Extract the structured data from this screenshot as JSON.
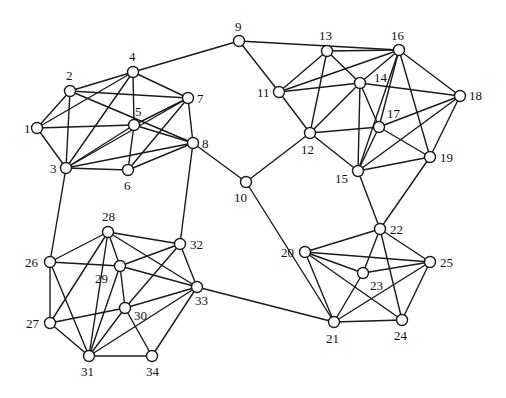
{
  "diagram": {
    "type": "undirected-graph",
    "node_radius": 5.5,
    "colors": {
      "edge": "#1a1a1a",
      "node_fill": "#ffffff",
      "label": "#111111",
      "background": "#ffffff"
    },
    "nodes": [
      {
        "id": "1",
        "x": 37,
        "y": 128,
        "lx": 24,
        "ly": 133
      },
      {
        "id": "2",
        "x": 70,
        "y": 91,
        "lx": 66,
        "ly": 80
      },
      {
        "id": "3",
        "x": 66,
        "y": 168,
        "lx": 50,
        "ly": 173
      },
      {
        "id": "4",
        "x": 133,
        "y": 72,
        "lx": 129,
        "ly": 61
      },
      {
        "id": "5",
        "x": 134,
        "y": 125,
        "lx": 135,
        "ly": 116
      },
      {
        "id": "6",
        "x": 128,
        "y": 170,
        "lx": 124,
        "ly": 190
      },
      {
        "id": "7",
        "x": 188,
        "y": 98,
        "lx": 197,
        "ly": 103
      },
      {
        "id": "8",
        "x": 193,
        "y": 143,
        "lx": 202,
        "ly": 148
      },
      {
        "id": "9",
        "x": 239,
        "y": 41,
        "lx": 235,
        "ly": 31
      },
      {
        "id": "10",
        "x": 246,
        "y": 182,
        "lx": 234,
        "ly": 202
      },
      {
        "id": "11",
        "x": 279,
        "y": 92,
        "lx": 257,
        "ly": 97
      },
      {
        "id": "12",
        "x": 310,
        "y": 133,
        "lx": 301,
        "ly": 154
      },
      {
        "id": "13",
        "x": 327,
        "y": 51,
        "lx": 319,
        "ly": 40
      },
      {
        "id": "14",
        "x": 360,
        "y": 83,
        "lx": 374,
        "ly": 82
      },
      {
        "id": "15",
        "x": 358,
        "y": 171,
        "lx": 335,
        "ly": 183
      },
      {
        "id": "16",
        "x": 399,
        "y": 50,
        "lx": 391,
        "ly": 40
      },
      {
        "id": "17",
        "x": 379,
        "y": 127,
        "lx": 387,
        "ly": 118
      },
      {
        "id": "18",
        "x": 460,
        "y": 96,
        "lx": 469,
        "ly": 100
      },
      {
        "id": "19",
        "x": 430,
        "y": 157,
        "lx": 440,
        "ly": 162
      },
      {
        "id": "20",
        "x": 305,
        "y": 252,
        "lx": 281,
        "ly": 257
      },
      {
        "id": "21",
        "x": 334,
        "y": 322,
        "lx": 326,
        "ly": 343
      },
      {
        "id": "22",
        "x": 380,
        "y": 229,
        "lx": 390,
        "ly": 234
      },
      {
        "id": "23",
        "x": 363,
        "y": 273,
        "lx": 370,
        "ly": 290
      },
      {
        "id": "24",
        "x": 402,
        "y": 320,
        "lx": 394,
        "ly": 340
      },
      {
        "id": "25",
        "x": 430,
        "y": 262,
        "lx": 440,
        "ly": 267
      },
      {
        "id": "26",
        "x": 50,
        "y": 262,
        "lx": 25,
        "ly": 267
      },
      {
        "id": "27",
        "x": 50,
        "y": 323,
        "lx": 26,
        "ly": 328
      },
      {
        "id": "28",
        "x": 108,
        "y": 232,
        "lx": 102,
        "ly": 221
      },
      {
        "id": "29",
        "x": 120,
        "y": 266,
        "lx": 95,
        "ly": 283
      },
      {
        "id": "30",
        "x": 125,
        "y": 308,
        "lx": 134,
        "ly": 320
      },
      {
        "id": "31",
        "x": 89,
        "y": 356,
        "lx": 81,
        "ly": 376
      },
      {
        "id": "32",
        "x": 180,
        "y": 244,
        "lx": 190,
        "ly": 249
      },
      {
        "id": "33",
        "x": 197,
        "y": 287,
        "lx": 195,
        "ly": 305
      },
      {
        "id": "34",
        "x": 152,
        "y": 356,
        "lx": 146,
        "ly": 376
      }
    ],
    "edges": [
      [
        "1",
        "2"
      ],
      [
        "1",
        "3"
      ],
      [
        "1",
        "4"
      ],
      [
        "1",
        "5"
      ],
      [
        "2",
        "3"
      ],
      [
        "2",
        "4"
      ],
      [
        "2",
        "7"
      ],
      [
        "2",
        "8"
      ],
      [
        "3",
        "4"
      ],
      [
        "3",
        "5"
      ],
      [
        "3",
        "6"
      ],
      [
        "3",
        "7"
      ],
      [
        "3",
        "8"
      ],
      [
        "4",
        "5"
      ],
      [
        "4",
        "7"
      ],
      [
        "4",
        "9"
      ],
      [
        "5",
        "6"
      ],
      [
        "5",
        "7"
      ],
      [
        "5",
        "8"
      ],
      [
        "6",
        "7"
      ],
      [
        "6",
        "8"
      ],
      [
        "7",
        "8"
      ],
      [
        "8",
        "10"
      ],
      [
        "8",
        "32"
      ],
      [
        "3",
        "26"
      ],
      [
        "9",
        "11"
      ],
      [
        "9",
        "16"
      ],
      [
        "10",
        "12"
      ],
      [
        "10",
        "21"
      ],
      [
        "11",
        "12"
      ],
      [
        "11",
        "13"
      ],
      [
        "11",
        "14"
      ],
      [
        "11",
        "16"
      ],
      [
        "12",
        "13"
      ],
      [
        "12",
        "14"
      ],
      [
        "12",
        "15"
      ],
      [
        "12",
        "17"
      ],
      [
        "13",
        "14"
      ],
      [
        "13",
        "16"
      ],
      [
        "14",
        "15"
      ],
      [
        "14",
        "17"
      ],
      [
        "14",
        "18"
      ],
      [
        "14",
        "16"
      ],
      [
        "15",
        "16"
      ],
      [
        "15",
        "17"
      ],
      [
        "15",
        "18"
      ],
      [
        "15",
        "19"
      ],
      [
        "15",
        "22"
      ],
      [
        "16",
        "18"
      ],
      [
        "16",
        "19"
      ],
      [
        "16",
        "17"
      ],
      [
        "17",
        "18"
      ],
      [
        "17",
        "19"
      ],
      [
        "18",
        "19"
      ],
      [
        "19",
        "22"
      ],
      [
        "20",
        "22"
      ],
      [
        "20",
        "21"
      ],
      [
        "20",
        "23"
      ],
      [
        "20",
        "24"
      ],
      [
        "20",
        "25"
      ],
      [
        "21",
        "23"
      ],
      [
        "21",
        "24"
      ],
      [
        "21",
        "25"
      ],
      [
        "22",
        "23"
      ],
      [
        "22",
        "24"
      ],
      [
        "22",
        "25"
      ],
      [
        "23",
        "25"
      ],
      [
        "24",
        "25"
      ],
      [
        "21",
        "33"
      ],
      [
        "26",
        "27"
      ],
      [
        "26",
        "28"
      ],
      [
        "26",
        "29"
      ],
      [
        "26",
        "31"
      ],
      [
        "27",
        "28"
      ],
      [
        "27",
        "30"
      ],
      [
        "27",
        "31"
      ],
      [
        "28",
        "29"
      ],
      [
        "28",
        "31"
      ],
      [
        "28",
        "32"
      ],
      [
        "28",
        "33"
      ],
      [
        "29",
        "30"
      ],
      [
        "29",
        "32"
      ],
      [
        "29",
        "33"
      ],
      [
        "29",
        "31"
      ],
      [
        "30",
        "32"
      ],
      [
        "30",
        "33"
      ],
      [
        "30",
        "31"
      ],
      [
        "30",
        "34"
      ],
      [
        "31",
        "33"
      ],
      [
        "31",
        "34"
      ],
      [
        "32",
        "33"
      ],
      [
        "33",
        "34"
      ]
    ]
  }
}
